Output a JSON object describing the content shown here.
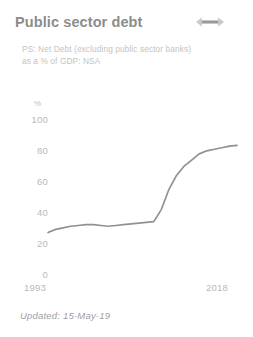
{
  "card": {
    "title": "Public sector debt",
    "drag_handle_icon": "horizontal-double-arrow-icon",
    "subtitle_line1": "PS: Net Debt (excluding public sector banks)",
    "subtitle_line2": "as a % of GDP: NSA",
    "footer": "Updated: 15-May-19"
  },
  "colors": {
    "title": "#8c8c8c",
    "subtitle": "#c3c3c3",
    "tick": "#b9b9b9",
    "line": "#919191",
    "background": "#ffffff"
  },
  "chart_data": {
    "type": "line",
    "title": "Public sector debt",
    "subtitle": "PS: Net Debt (excluding public sector banks) as a % of GDP: NSA",
    "xlabel": "",
    "ylabel": "%",
    "unit": "%",
    "grid": false,
    "legend": "none",
    "xlim": [
      1993,
      2018
    ],
    "ylim": [
      0,
      100
    ],
    "xticks": [
      "1993",
      "2018"
    ],
    "yticks": [
      "0",
      "20",
      "40",
      "60",
      "80",
      "100"
    ],
    "series": [
      {
        "name": "PS Net Debt as % of GDP",
        "x": [
          1993,
          1994,
          1995,
          1996,
          1997,
          1998,
          1999,
          2000,
          2001,
          2002,
          2003,
          2004,
          2005,
          2006,
          2007,
          2008,
          2009,
          2010,
          2011,
          2012,
          2013,
          2014,
          2015,
          2016,
          2017,
          2018
        ],
        "values": [
          27,
          29,
          30,
          31,
          31.5,
          32,
          32,
          31.5,
          31,
          31.5,
          32,
          32.5,
          33,
          33.5,
          34,
          42,
          55,
          64,
          70,
          74,
          78,
          80,
          81,
          82,
          83,
          83.5
        ]
      }
    ]
  }
}
